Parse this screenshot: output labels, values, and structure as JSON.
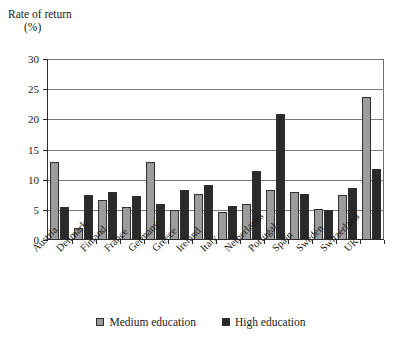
{
  "chart_data": {
    "type": "bar",
    "title": "",
    "ylabel": "Rate of return",
    "yunit": "(%)",
    "xlabel": "",
    "ylim": [
      0,
      30
    ],
    "yticks": [
      0,
      5,
      10,
      15,
      20,
      25,
      30
    ],
    "grid": true,
    "legend_position": "bottom",
    "categories": [
      "Austria",
      "Denmark",
      "Finland",
      "France",
      "Germany",
      "Greece",
      "Ireland",
      "Italy",
      "Netherlands",
      "Portugal",
      "Spain",
      "Sweden",
      "Switzerland",
      "UK"
    ],
    "series": [
      {
        "name": "Medium education",
        "color": "#9c9c9c",
        "values": [
          13.0,
          2.0,
          6.7,
          5.5,
          12.9,
          4.9,
          7.7,
          4.6,
          6.0,
          8.3,
          8.0,
          5.2,
          7.5,
          23.7
        ]
      },
      {
        "name": "High education",
        "color": "#2a2a2a",
        "values": [
          5.5,
          7.5,
          7.9,
          7.3,
          5.9,
          8.3,
          9.1,
          5.7,
          11.5,
          20.9,
          7.7,
          5.0,
          8.7,
          11.7
        ]
      }
    ]
  },
  "legend": {
    "items": [
      {
        "label": "Medium education",
        "color": "#9c9c9c"
      },
      {
        "label": "High education",
        "color": "#2a2a2a"
      }
    ]
  }
}
